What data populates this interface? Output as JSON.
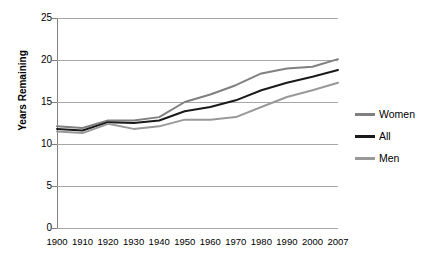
{
  "chart_data": {
    "type": "line",
    "title": "",
    "xlabel": "",
    "ylabel": "Years Remaining",
    "categories": [
      "1900",
      "1910",
      "1920",
      "1930",
      "1940",
      "1950",
      "1960",
      "1970",
      "1980",
      "1990",
      "2000",
      "2007"
    ],
    "ylim": [
      0,
      25
    ],
    "yticks": [
      "0",
      "5",
      "10",
      "15",
      "20",
      "25"
    ],
    "grid": "horizontal",
    "legend_position": "right",
    "series": [
      {
        "name": "Women",
        "color": "#808080",
        "values": [
          12.1,
          11.9,
          12.8,
          12.8,
          13.2,
          15.0,
          15.9,
          17.0,
          18.4,
          19.0,
          19.2,
          20.1
        ]
      },
      {
        "name": "All",
        "color": "#1a1a1a",
        "values": [
          11.8,
          11.6,
          12.6,
          12.5,
          12.8,
          13.9,
          14.4,
          15.2,
          16.4,
          17.3,
          18.0,
          18.8
        ]
      },
      {
        "name": "Men",
        "color": "#999999",
        "values": [
          11.5,
          11.3,
          12.4,
          11.8,
          12.1,
          12.9,
          12.9,
          13.2,
          14.4,
          15.6,
          16.4,
          17.3
        ]
      }
    ]
  },
  "colors": {
    "background": "#ffffff",
    "gridline": "#a6a6a6",
    "axis": "#7f7f7f",
    "text": "#000000"
  },
  "legend": {
    "items": [
      {
        "label": "Women"
      },
      {
        "label": "All"
      },
      {
        "label": "Men"
      }
    ]
  }
}
